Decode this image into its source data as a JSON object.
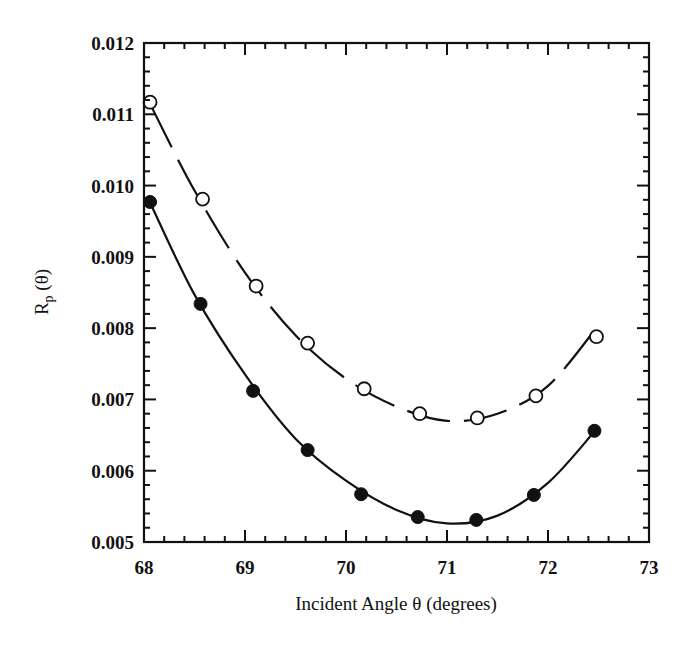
{
  "chart_data": {
    "type": "scatter",
    "title": "",
    "xlabel": "Incident Angle θ (degrees)",
    "ylabel": "R_p (θ)",
    "ylabel_main": "R",
    "ylabel_sub": "p",
    "ylabel_rest": " (θ)",
    "xlim": [
      68,
      73
    ],
    "ylim": [
      0.005,
      0.012
    ],
    "x_ticks": [
      68,
      69,
      70,
      71,
      72,
      73
    ],
    "x_tick_labels": [
      "68",
      "69",
      "70",
      "71",
      "72",
      "73"
    ],
    "x_minor_step": 0.2,
    "y_ticks": [
      0.005,
      0.006,
      0.007,
      0.008,
      0.009,
      0.01,
      0.011,
      0.012
    ],
    "y_tick_labels": [
      "0.005",
      "0.006",
      "0.007",
      "0.008",
      "0.009",
      "0.010",
      "0.011",
      "0.012"
    ],
    "y_minor_step": 0.0002,
    "grid": false,
    "legend": null,
    "series": [
      {
        "name": "open circles (measured)",
        "marker": "open-circle",
        "x": [
          68.06,
          68.58,
          69.11,
          69.62,
          70.18,
          70.73,
          71.3,
          71.88,
          72.48
        ],
        "y": [
          0.01117,
          0.00981,
          0.00859,
          0.00779,
          0.00715,
          0.0068,
          0.00674,
          0.00705,
          0.00788
        ]
      },
      {
        "name": "filled circles (measured)",
        "marker": "filled-circle",
        "x": [
          68.06,
          68.56,
          69.08,
          69.62,
          70.15,
          70.71,
          71.29,
          71.86,
          72.46
        ],
        "y": [
          0.00977,
          0.00834,
          0.00712,
          0.00629,
          0.00567,
          0.00535,
          0.00531,
          0.00566,
          0.00656
        ]
      },
      {
        "name": "dashed fit curve",
        "line": "dashed",
        "x": [
          68.08,
          68.5,
          69.0,
          69.5,
          70.0,
          70.5,
          71.0,
          71.5,
          72.0,
          72.5
        ],
        "y": [
          0.01109,
          0.00993,
          0.00878,
          0.0079,
          0.00729,
          0.0069,
          0.0067,
          0.0068,
          0.00719,
          0.00804
        ]
      },
      {
        "name": "solid fit curve",
        "line": "solid",
        "x": [
          68.08,
          68.5,
          69.0,
          69.5,
          70.0,
          70.5,
          71.0,
          71.5,
          72.0,
          72.46
        ],
        "y": [
          0.0097,
          0.00847,
          0.00735,
          0.00645,
          0.00586,
          0.00545,
          0.00526,
          0.00537,
          0.00583,
          0.00655
        ]
      }
    ]
  },
  "layout": {
    "plot_left": 144,
    "plot_right": 649,
    "plot_top": 43,
    "plot_bottom": 542,
    "ink_color": "#111111"
  }
}
